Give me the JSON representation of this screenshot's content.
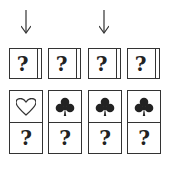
{
  "arrows": [
    {
      "column": 1
    },
    {
      "column": 3
    }
  ],
  "top_row": [
    {
      "label": "?"
    },
    {
      "label": "?"
    },
    {
      "label": "?"
    },
    {
      "label": "?"
    }
  ],
  "bottom_row": [
    {
      "symbol": "heart-outline",
      "label": "?"
    },
    {
      "symbol": "club",
      "label": "?"
    },
    {
      "symbol": "club",
      "label": "?"
    },
    {
      "symbol": "club",
      "label": "?"
    }
  ]
}
